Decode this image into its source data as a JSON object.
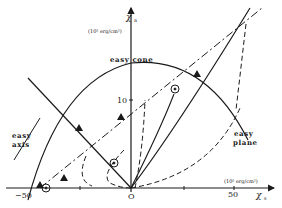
{
  "diagram": {
    "y_axis": {
      "symbol": "χ",
      "subscript": "a",
      "unit": "(10⁵ erg/cm³)",
      "tick_label": "10"
    },
    "x_axis": {
      "symbol": "χ",
      "subscript": "s",
      "unit": "(10⁵ erg/cm³)",
      "tick_labels": [
        "−50",
        "O",
        "50"
      ]
    },
    "region_labels": {
      "easy_cone": "easy cone",
      "easy_axis_line1": "easy",
      "easy_axis_line2": "axis",
      "easy_plane_line1": "easy",
      "easy_plane_line2": "plane"
    },
    "markers": {
      "triangle": "filled-triangle",
      "circled_dot": "circled-dot"
    },
    "colors": {
      "ink": "#1a1a1a",
      "background": "#ffffff"
    }
  }
}
